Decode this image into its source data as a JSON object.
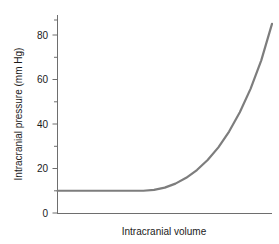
{
  "chart_data": {
    "type": "line",
    "title": "",
    "xlabel": "Intracranial volume",
    "ylabel": "Intracranial pressure (mm Hg)",
    "xlim": [
      0,
      100
    ],
    "ylim": [
      0,
      88
    ],
    "grid": false,
    "legend": "none",
    "y_major_ticks": [
      0,
      20,
      40,
      60,
      80
    ],
    "y_minor_ticks": [
      10,
      30,
      50,
      70
    ],
    "y_tick_labels": [
      "0",
      "20",
      "40",
      "60",
      "80"
    ],
    "x_tick_labels": [],
    "series": [
      {
        "name": "Pressure-volume compliance curve",
        "line_color": "#7d7d7d",
        "line_width": 2.2,
        "x": [
          0,
          5,
          10,
          15,
          20,
          25,
          30,
          35,
          40,
          45,
          50,
          55,
          60,
          65,
          70,
          75,
          80,
          85,
          90,
          95,
          100
        ],
        "y": [
          10,
          10,
          10,
          10,
          10,
          10,
          10,
          10,
          10,
          10.4,
          11.4,
          13.2,
          15.8,
          19.3,
          23.8,
          29.5,
          36.6,
          45.3,
          55.8,
          68.6,
          85
        ]
      }
    ]
  },
  "axes": {
    "y_label_text": "Intracranial pressure (mm Hg)",
    "x_label_text": "Intracranial volume",
    "tick_0": "0",
    "tick_20": "20",
    "tick_40": "40",
    "tick_60": "60",
    "tick_80": "80"
  },
  "colors": {
    "curve": "#7d7d7d",
    "axis": "#6e6e6e",
    "text": "#1a1a1a",
    "background": "#ffffff"
  }
}
